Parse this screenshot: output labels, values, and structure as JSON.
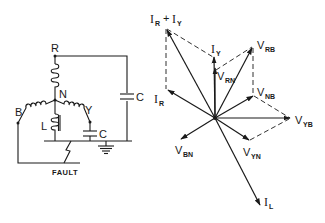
{
  "circuit": {
    "nodes": {
      "R": "R",
      "N": "N",
      "B": "B",
      "Y": "Y"
    },
    "inductor_label": "L",
    "capacitor_label_right": "C",
    "capacitor_label_y": "C",
    "fault_label": "FAULT"
  },
  "phasor": {
    "labels": {
      "ir_plus_iy": {
        "main": "I",
        "sub1": "R",
        "plus": "+",
        "main2": "I",
        "sub2": "Y"
      },
      "iy": {
        "main": "I",
        "sub": "Y"
      },
      "vrb": {
        "main": "V",
        "sub": "RB"
      },
      "vrn": {
        "main": "V",
        "sub": "RN"
      },
      "ir": {
        "main": "I",
        "sub": "R"
      },
      "vnb": {
        "main": "V",
        "sub": "NB"
      },
      "vyb": {
        "main": "V",
        "sub": "YB"
      },
      "vyn": {
        "main": "V",
        "sub": "YN"
      },
      "vbn": {
        "main": "V",
        "sub": "BN"
      },
      "il": {
        "main": "I",
        "sub": "L"
      }
    },
    "colors": {
      "ink": "#1a1a1a",
      "background": "#ffffff"
    }
  }
}
